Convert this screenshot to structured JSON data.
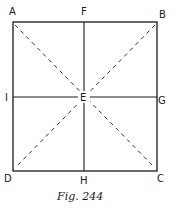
{
  "figure": {
    "caption": "Fig. 244",
    "stroke_color": "#1a1a1a",
    "background": "#ffffff"
  },
  "points": {
    "A": {
      "label": "A",
      "x": 13,
      "y": 22
    },
    "B": {
      "label": "B",
      "x": 157,
      "y": 22
    },
    "C": {
      "label": "C",
      "x": 157,
      "y": 171
    },
    "D": {
      "label": "D",
      "x": 13,
      "y": 171
    },
    "E": {
      "label": "E",
      "x": 84,
      "y": 97
    },
    "F": {
      "label": "F",
      "x": 84,
      "y": 22
    },
    "G": {
      "label": "G",
      "x": 157,
      "y": 97
    },
    "H": {
      "label": "H",
      "x": 84,
      "y": 171
    },
    "I": {
      "label": "I",
      "x": 13,
      "y": 97
    }
  },
  "lines": {
    "solid": [
      {
        "from": "A",
        "to": "B"
      },
      {
        "from": "B",
        "to": "C"
      },
      {
        "from": "C",
        "to": "D"
      },
      {
        "from": "D",
        "to": "A"
      },
      {
        "from": "F",
        "to": "H"
      },
      {
        "from": "I",
        "to": "G"
      }
    ],
    "dashed": [
      {
        "from": "A",
        "to": "C"
      },
      {
        "from": "B",
        "to": "D"
      }
    ]
  }
}
